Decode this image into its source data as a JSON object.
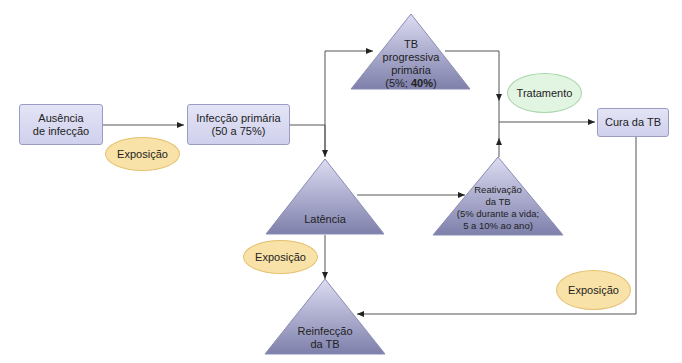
{
  "nodes": {
    "ausencia": {
      "line1": "Ausência",
      "line2": "de infecção"
    },
    "infeccao": {
      "line1": "Infecção primária",
      "line2": "(50 a 75%)"
    },
    "tb_progressiva": {
      "line1": "TB",
      "line2": "progressiva",
      "line3": "primária",
      "line4_pre": "(5%; ",
      "line4_bold": "40%",
      "line4_post": ")"
    },
    "latencia": {
      "label": "Latência"
    },
    "reativacao": {
      "line1": "Reativação",
      "line2": "da TB",
      "line3": "(5% durante a vida;",
      "line4": "5 a 10% ao ano)"
    },
    "reinfeccao": {
      "line1": "Reinfecção",
      "line2": "da TB"
    },
    "cura": {
      "label": "Cura da TB"
    }
  },
  "ovals": {
    "exposicao1": "Exposição",
    "exposicao2": "Exposição",
    "exposicao3": "Exposição",
    "tratamento": "Tratamento"
  },
  "colors": {
    "box_fill": "#d8d9f0",
    "triangle_top": "#d4d5ee",
    "triangle_bottom": "#7f80aa",
    "exposure_fill": "#f9e2a8",
    "treatment_fill": "#e2f4e2",
    "line": "#444444"
  }
}
